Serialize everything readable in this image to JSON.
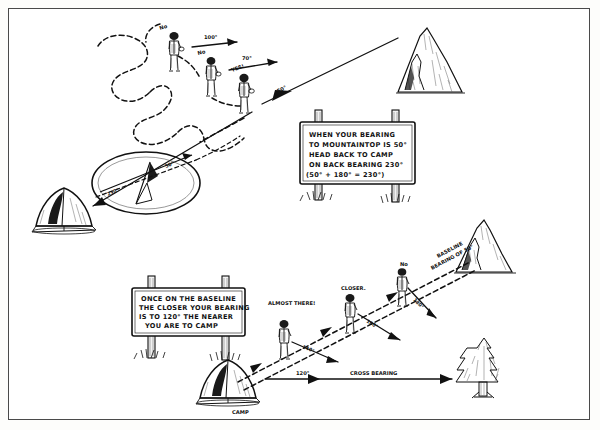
{
  "figure": {
    "style": "hand-drawn pen and ink diagram"
  },
  "top_scene": {
    "walkers": [
      {
        "id": "walker-1",
        "speech": "No",
        "bearing_label": "100°"
      },
      {
        "id": "walker-2",
        "speech": "No",
        "bearing_label": "70°"
      },
      {
        "id": "walker-3",
        "speech": "YES!",
        "bearing_label": "50°"
      }
    ],
    "mountain_label": "",
    "tent_label": "",
    "compass": {
      "back_bearing_label": "230°",
      "forward_bearing_label": "50°"
    }
  },
  "sign_top": {
    "lines": [
      "WHEN YOUR BEARING",
      "TO MOUNTAINTOP IS 50°",
      "HEAD BACK TO CAMP",
      "ON BACK BEARING 230°",
      "(50° + 180° = 230°)"
    ]
  },
  "sign_bottom": {
    "lines": [
      "ONCE ON THE BASELINE",
      "THE CLOSER YOUR BEARING",
      "IS TO 120° THE NEARER",
      "YOU ARE TO CAMP"
    ]
  },
  "bottom_scene": {
    "baseline_label": "BASELINE",
    "baseline_bearing_label": "BEARING OF 50°",
    "walkers": [
      {
        "id": "walker-4",
        "speech": "ALMOST THERE!",
        "bearing_label": "140°"
      },
      {
        "id": "walker-5",
        "speech": "CLOSER.",
        "bearing_label": "160°"
      },
      {
        "id": "walker-6",
        "speech": "No",
        "bearing_label": "180°"
      }
    ],
    "camp_label": "CAMP",
    "cross_bearing_value": "120°",
    "cross_bearing_label": "CROSS BEARING"
  },
  "colors": {
    "ink": "#111111",
    "paper": "#ffffff",
    "frame": "#4a4a4a"
  }
}
